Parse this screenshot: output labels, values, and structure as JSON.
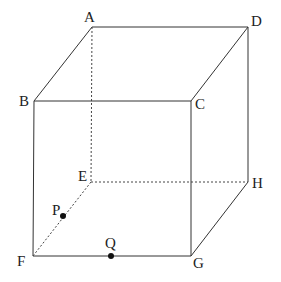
{
  "diagram": {
    "type": "cube",
    "vertices": {
      "A": {
        "label": "A",
        "x": 92,
        "y": 27
      },
      "B": {
        "label": "B",
        "x": 34,
        "y": 101
      },
      "C": {
        "label": "C",
        "x": 191,
        "y": 101
      },
      "D": {
        "label": "D",
        "x": 248,
        "y": 27
      },
      "E": {
        "label": "E",
        "x": 91,
        "y": 182
      },
      "F": {
        "label": "F",
        "x": 33,
        "y": 256
      },
      "G": {
        "label": "G",
        "x": 191,
        "y": 256
      },
      "H": {
        "label": "H",
        "x": 248,
        "y": 182
      }
    },
    "points": {
      "P": {
        "label": "P",
        "on_edge": "EF",
        "x": 63,
        "y": 216
      },
      "Q": {
        "label": "Q",
        "on_edge": "FG",
        "x": 111,
        "y": 256
      }
    },
    "visible_edges": [
      "AB",
      "AD",
      "BC",
      "CD",
      "BF",
      "CG",
      "DH",
      "FG",
      "GH"
    ],
    "hidden_edges": [
      "AE",
      "EF",
      "EH"
    ],
    "colors": {
      "line": "#333333",
      "point": "#111111",
      "background": "#ffffff"
    }
  }
}
